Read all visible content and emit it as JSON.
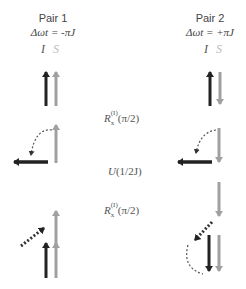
{
  "pairs": [
    {
      "title": "Pair 1",
      "offset": "Δωt = -πJ",
      "spin_labels": {
        "I": "I",
        "S": "S"
      }
    },
    {
      "title": "Pair 2",
      "offset": "Δωt = +πJ",
      "spin_labels": {
        "I": "I",
        "S": "S"
      }
    }
  ],
  "operators": [
    {
      "base": "R",
      "sub": "x",
      "sup": "(I)",
      "arg": "(π/2)"
    },
    {
      "base": "U",
      "arg": "(1/2J)"
    },
    {
      "base": "R",
      "sub": "x",
      "sup": "(I)",
      "arg": "(π/2)"
    }
  ],
  "colors": {
    "I_spin": "#222222",
    "S_spin": "#a0a0a0",
    "text": "#444444"
  },
  "states": {
    "pair1": [
      "I up, S up",
      "I along -x (left), S up",
      "I diagonal (dotted), S up",
      "I up, S up"
    ],
    "pair2": [
      "I up, S down",
      "I along -x (left), S down",
      "S down only",
      "I down, S down"
    ]
  }
}
